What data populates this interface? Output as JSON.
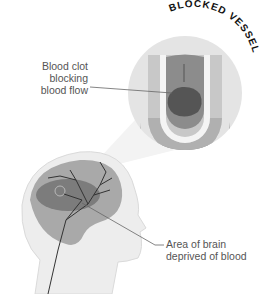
{
  "title": "BLOCKED VESSEL",
  "labels": {
    "clot": [
      "Blood clot",
      "blocking",
      "blood flow"
    ],
    "area": [
      "Area of brain",
      "deprived of blood"
    ]
  },
  "colors": {
    "circle": "#e4e4e4",
    "vessel_wall": "#c4c4c4",
    "vessel_inner": "#8a8a8a",
    "clot": "#5a5a5a",
    "brain": "#a8a8a8",
    "affected_area": "#7a7a7a",
    "head": "#ececec"
  }
}
